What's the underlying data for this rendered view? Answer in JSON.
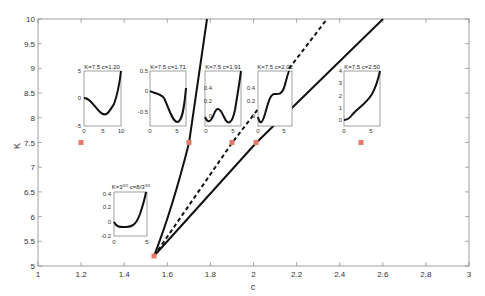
{
  "chart_data": {
    "type": "line",
    "title": "",
    "xlabel": "c",
    "ylabel": "K",
    "xlim": [
      1,
      3
    ],
    "ylim": [
      5,
      10
    ],
    "xticks": [
      "1",
      "1.2",
      "1.4",
      "1.6",
      "1.8",
      "2",
      "2.2",
      "2.4",
      "2.6",
      "2.8",
      "3"
    ],
    "yticks": [
      "5",
      "5.5",
      "6",
      "6.5",
      "7",
      "7.5",
      "8",
      "8.5",
      "9",
      "9.5",
      "10"
    ],
    "grid": false,
    "legend": null,
    "series": [
      {
        "name": "left-boundary",
        "style": "solid",
        "x": [
          1.54,
          1.58,
          1.63,
          1.67,
          1.71,
          1.76
        ],
        "y": [
          5.2,
          5.9,
          6.7,
          7.1,
          7.5,
          10.0
        ]
      },
      {
        "name": "middle-dashed",
        "style": "dashed",
        "x": [
          1.54,
          1.7,
          1.91,
          2.1,
          2.34
        ],
        "y": [
          5.2,
          6.2,
          7.5,
          8.7,
          10.0
        ]
      },
      {
        "name": "right-boundary",
        "style": "solid",
        "x": [
          1.54,
          1.8,
          2.02,
          2.3,
          2.6
        ],
        "y": [
          5.2,
          6.3,
          7.5,
          8.7,
          10.0
        ]
      }
    ],
    "markers": [
      {
        "c": 1.2,
        "K": 7.5
      },
      {
        "c": 1.71,
        "K": 7.5
      },
      {
        "c": 1.91,
        "K": 7.5
      },
      {
        "c": 2.02,
        "K": 7.5
      },
      {
        "c": 2.5,
        "K": 7.5
      },
      {
        "c": 1.54,
        "K": 5.2
      }
    ],
    "marker_color": "#e07a6a",
    "insets": [
      {
        "title": "K=7.5 c=1.20",
        "xticks": [
          "0",
          "5",
          "10"
        ],
        "yticks": [
          "5",
          "0",
          "-5"
        ]
      },
      {
        "title": "K=7.5 c=1.71",
        "xticks": [
          "0",
          "5"
        ],
        "yticks": [
          "0.5",
          "0",
          "-0.5"
        ]
      },
      {
        "title": "K=7.5 c=1.91",
        "xticks": [
          "0",
          "5"
        ],
        "yticks": [
          "0.4",
          "0.2",
          "0"
        ]
      },
      {
        "title": "K=7.5 c=2.02",
        "xticks": [
          "0",
          "5"
        ],
        "yticks": [
          "0.4",
          "0.2",
          "0"
        ]
      },
      {
        "title": "K=7.5 c=2.50",
        "xticks": [
          "0",
          "5"
        ],
        "yticks": [
          "4",
          "3",
          "2",
          "1",
          "0"
        ]
      },
      {
        "title": "K=3^(3/2) c=8/3^(3/2)",
        "xticks": [
          "0",
          "5"
        ],
        "yticks": [
          "0.4",
          "0.2",
          "0",
          "-0.2"
        ]
      }
    ]
  },
  "labels": {
    "xlabel": "c",
    "ylabel": "K",
    "inset1_title": "K=7.5 c=1.20",
    "inset2_title": "K=7.5 c=1.71",
    "inset3_title": "K=7.5 c=1.91",
    "inset4_title": "K=7.5 c=2.02",
    "inset5_title": "K=7.5 c=2.50",
    "inset6_title_k": "K=3",
    "inset6_title_k_exp": "3/2",
    "inset6_title_c": " c=8/3",
    "inset6_title_c_exp": "3/2"
  }
}
